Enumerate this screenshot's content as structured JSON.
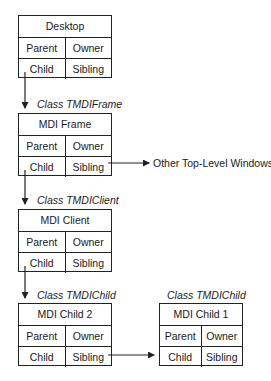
{
  "diagram": {
    "windows": [
      {
        "id": "desktop",
        "title": "Desktop",
        "class_label": "",
        "cells": [
          "Parent",
          "Owner",
          "Child",
          "Sibling"
        ]
      },
      {
        "id": "mdi-frame",
        "title": "MDI Frame",
        "class_label": "Class TMDIFrame",
        "cells": [
          "Parent",
          "Owner",
          "Child",
          "Sibling"
        ]
      },
      {
        "id": "mdi-client",
        "title": "MDI Client",
        "class_label": "Class TMDIClient",
        "cells": [
          "Parent",
          "Owner",
          "Child",
          "Sibling"
        ]
      },
      {
        "id": "mdi-child-2",
        "title": "MDI Child 2",
        "class_label": "Class TMDIChild",
        "cells": [
          "Parent",
          "Owner",
          "Child",
          "Sibling"
        ]
      },
      {
        "id": "mdi-child-1",
        "title": "MDI Child 1",
        "class_label": "Class TMDIChild",
        "cells": [
          "Parent",
          "Owner",
          "Child",
          "Sibling"
        ]
      }
    ],
    "external_target": "Other Top-Level Windows",
    "edges": [
      {
        "from": "desktop.Child",
        "to": "mdi-frame"
      },
      {
        "from": "mdi-frame.Sibling",
        "to": "Other Top-Level Windows"
      },
      {
        "from": "mdi-frame.Child",
        "to": "mdi-client"
      },
      {
        "from": "mdi-client.Child",
        "to": "mdi-child-2"
      },
      {
        "from": "mdi-child-2.Sibling",
        "to": "mdi-child-1"
      }
    ],
    "colors": {
      "line": "#222222",
      "background": "#ffffff"
    }
  }
}
